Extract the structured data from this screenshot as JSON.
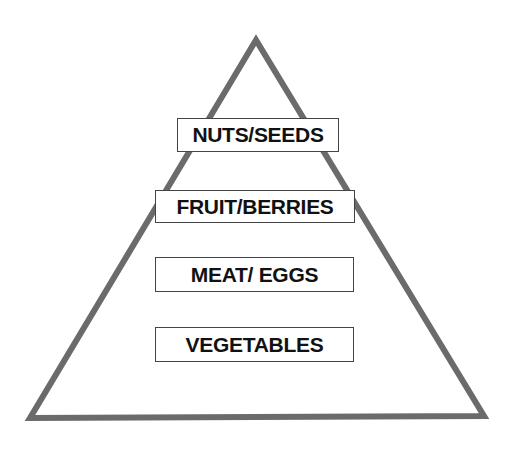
{
  "diagram": {
    "type": "pyramid",
    "levels": [
      {
        "label": "NUTS/SEEDS"
      },
      {
        "label": "FRUIT/BERRIES"
      },
      {
        "label": "MEAT/ EGGS"
      },
      {
        "label": "VEGETABLES"
      }
    ],
    "colors": {
      "outline": "#6b6b6b",
      "box_border": "#444444",
      "text": "#111111"
    }
  }
}
